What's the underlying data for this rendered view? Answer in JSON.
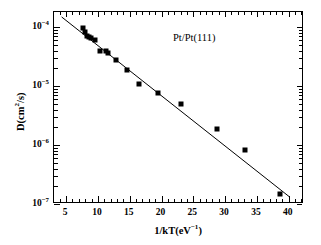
{
  "chart_data": {
    "type": "scatter",
    "title": "",
    "xlabel": "1/kT(eV^-1)",
    "ylabel": "D(cm^2/s)",
    "xlabel_parts": {
      "base": "1/kT(eV",
      "sup": "−1",
      "tail": ")"
    },
    "ylabel_parts": {
      "base": "D(cm",
      "sup": "2",
      "tail": "/s)"
    },
    "xscale": "linear",
    "yscale": "log",
    "xlim": [
      3.1,
      42.4
    ],
    "ylim": [
      1e-07,
      0.000182
    ],
    "xticks": [
      5,
      10,
      15,
      20,
      25,
      30,
      35,
      40
    ],
    "xticklabels": [
      "5",
      "10",
      "15",
      "20",
      "25",
      "30",
      "35",
      "40"
    ],
    "x_minor_ticks": [
      4,
      6,
      7,
      8,
      9,
      11,
      12,
      13,
      14,
      16,
      17,
      18,
      19,
      21,
      22,
      23,
      24,
      26,
      27,
      28,
      29,
      31,
      32,
      33,
      34,
      36,
      37,
      38,
      39,
      41,
      42
    ],
    "yticks": [
      0.0001,
      1e-05,
      1e-06,
      1e-07
    ],
    "yticklabels": [
      {
        "mantissa": "10",
        "exponent": "−4"
      },
      {
        "mantissa": "10",
        "exponent": "−5"
      },
      {
        "mantissa": "10",
        "exponent": "−6"
      },
      {
        "mantissa": "10",
        "exponent": "−7"
      }
    ],
    "grid": false,
    "legend": null,
    "marker": {
      "shape": "square",
      "color": "#000000",
      "size_px": 5
    },
    "series": [
      {
        "name": "Pt/Pt(111) diffusivity",
        "x": [
          7.6,
          7.9,
          8.3,
          8.6,
          8.9,
          9.5,
          10.4,
          11.2,
          11.6,
          12.9,
          14.5,
          16.4,
          19.4,
          23.0,
          28.7,
          33.2,
          38.7
        ],
        "y": [
          9.6e-05,
          8.4e-05,
          7.2e-05,
          6.8e-05,
          6.6e-05,
          6.1e-05,
          3.9e-05,
          3.9e-05,
          3.7e-05,
          2.8e-05,
          1.9e-05,
          1.1e-05,
          7.6e-06,
          4.9e-06,
          1.9e-06,
          8.3e-07,
          1.45e-07
        ]
      }
    ],
    "fit": {
      "name": "Arrhenius linear fit",
      "x_start": 4.3,
      "y_start": 0.00015,
      "x_end": 40.2,
      "y_end": 1.3e-07,
      "color": "#000000",
      "width_px": 1.0
    },
    "annotations": [
      {
        "text": "Pt/Pt(111)",
        "x_px": 173,
        "y_px": 33
      }
    ]
  }
}
